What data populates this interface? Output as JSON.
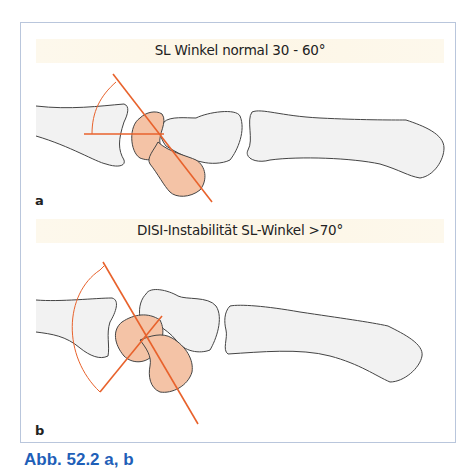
{
  "figure": {
    "panel_a": {
      "title": "SL Winkel normal 30 - 60°",
      "label": "a"
    },
    "panel_b": {
      "title": "DISI-Instabilität   SL-Winkel >70°",
      "label": "b"
    },
    "caption": "Abb. 52.2 a, b"
  },
  "colors": {
    "bone_fill": "#f2f2f2",
    "bone_stroke": "#444444",
    "highlight_fill": "#f4c3a6",
    "angle_line": "#e8622c",
    "band": "#fdf7e8",
    "panel_border": "#b9c6dc",
    "caption": "#1f5fb8"
  }
}
